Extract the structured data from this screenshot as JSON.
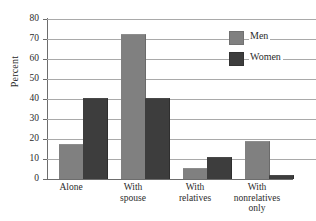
{
  "chart_data": {
    "type": "bar",
    "title": "",
    "xlabel": "",
    "ylabel": "Percent",
    "ylim": [
      0,
      80
    ],
    "yticks": [
      0,
      10,
      20,
      30,
      40,
      50,
      60,
      70,
      80
    ],
    "grid": true,
    "legend_position": "top-right",
    "categories": [
      "Alone",
      "With spouse",
      "With relatives",
      "With nonrelatives only"
    ],
    "category_lines": [
      [
        "Alone"
      ],
      [
        "With",
        "spouse"
      ],
      [
        "With",
        "relatives"
      ],
      [
        "With",
        "nonrelatives",
        "only"
      ]
    ],
    "series": [
      {
        "name": "Men",
        "color": "#808080",
        "values": [
          17,
          72,
          5,
          18.5
        ]
      },
      {
        "name": "Women",
        "color": "#3d3d3d",
        "values": [
          40,
          40,
          10.5,
          1.5
        ]
      }
    ]
  },
  "axis": {
    "y_label": "Percent",
    "tick_80": "80",
    "tick_70": "70",
    "tick_60": "60",
    "tick_50": "50",
    "tick_40": "40",
    "tick_30": "30",
    "tick_20": "20",
    "tick_10": "10",
    "tick_0": "0"
  },
  "legend": {
    "men_label": "Men",
    "women_label": "Women"
  },
  "categories_text": {
    "c0_l0": "Alone",
    "c1_l0": "With",
    "c1_l1": "spouse",
    "c2_l0": "With",
    "c2_l1": "relatives",
    "c3_l0": "With",
    "c3_l1": "nonrelatives",
    "c3_l2": "only"
  }
}
